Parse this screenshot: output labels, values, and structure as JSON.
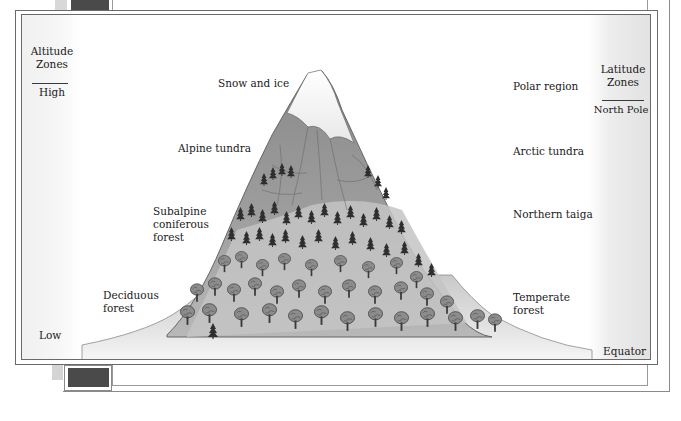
{
  "figure": {
    "type": "altitude-latitude comparison illustration",
    "altitude_axis": {
      "title_line1": "Altitude",
      "title_line2": "Zones",
      "top_label": "High",
      "bottom_label": "Low"
    },
    "latitude_axis": {
      "title_line1": "Latitude",
      "title_line2": "Zones",
      "top_label": "North Pole",
      "bottom_label": "Equator"
    },
    "altitude_zones": [
      {
        "label": "Snow and ice"
      },
      {
        "label": "Alpine tundra"
      },
      {
        "label_line1": "Subalpine",
        "label_line2": "coniferous",
        "label_line3": "forest"
      },
      {
        "label_line1": "Deciduous",
        "label_line2": "forest"
      }
    ],
    "latitude_zones": [
      {
        "label": "Polar region"
      },
      {
        "label": "Arctic tundra"
      },
      {
        "label": "Northern taiga"
      },
      {
        "label_line1": "Temperate",
        "label_line2": "forest"
      }
    ]
  },
  "colors": {
    "frame_line": "#6a6a6a",
    "snow": "#f4f4f4",
    "rock_dark": "#7d7d7d",
    "rock_mid": "#9a9a9a",
    "slope_light": "#c8c8c8",
    "tree_dark": "#2e2e2e",
    "side_band": "#e6e6e6",
    "tab_dark": "#4a4a4a"
  }
}
